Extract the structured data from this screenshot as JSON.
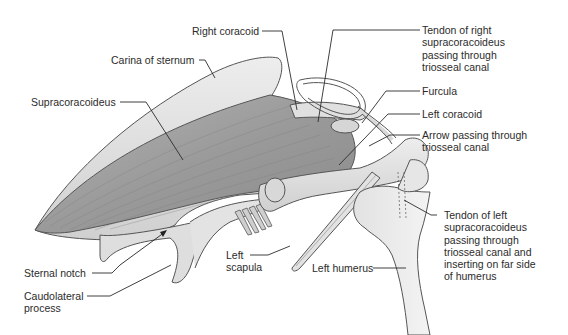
{
  "figure": {
    "colors": {
      "background": "#ffffff",
      "bone_light": "#e9e9e9",
      "bone_mid": "#d2d2d2",
      "muscle": "#9c9c9c",
      "muscle_dark": "#7a7a7a",
      "outline": "#555555",
      "leader_line": "#2b2b2b",
      "text": "#2b2b2b"
    }
  },
  "labels": {
    "right_coracoid": {
      "lines": [
        "Right coracoid"
      ]
    },
    "carina_of_sternum": {
      "lines": [
        "Carina of sternum"
      ]
    },
    "supracoracoideus": {
      "lines": [
        "Supracoracoideus"
      ]
    },
    "tendon_right": {
      "lines": [
        "Tendon of right",
        "supracoracoideus",
        "passing through",
        "triosseal canal"
      ]
    },
    "furcula": {
      "lines": [
        "Furcula"
      ]
    },
    "left_coracoid": {
      "lines": [
        "Left coracoid"
      ]
    },
    "arrow_triosseal": {
      "lines": [
        "Arrow passing through",
        "triosseal canal"
      ]
    },
    "sternal_notch": {
      "lines": [
        "Sternal notch"
      ]
    },
    "caudolateral_process": {
      "lines": [
        "Caudolateral",
        "process"
      ]
    },
    "left_scapula": {
      "lines": [
        "Left",
        "scapula"
      ]
    },
    "left_humerus": {
      "lines": [
        "Left humerus"
      ]
    },
    "tendon_left": {
      "lines": [
        "Tendon of left",
        "supracoracoideus",
        "passing through",
        "triosseal canal and",
        "inserting on far side",
        "of humerus"
      ]
    }
  }
}
